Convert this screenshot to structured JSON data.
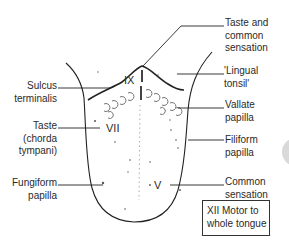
{
  "diagram": {
    "right_labels": [
      {
        "id": "taste_common",
        "lines": [
          "Taste and",
          "common",
          "sensation"
        ]
      },
      {
        "id": "lingual_tonsil",
        "lines": [
          "'Lingual",
          "tonsil'"
        ]
      },
      {
        "id": "vallate",
        "lines": [
          "Vallate",
          "papilla"
        ]
      },
      {
        "id": "filiform",
        "lines": [
          "Filiform",
          "papilla"
        ]
      },
      {
        "id": "common_sensation",
        "lines": [
          "Common",
          "sensation"
        ]
      }
    ],
    "left_labels": [
      {
        "id": "sulcus",
        "lines": [
          "Sulcus",
          "terminalis"
        ]
      },
      {
        "id": "taste_chorda",
        "lines": [
          "Taste",
          "(chorda",
          "tympani)"
        ]
      },
      {
        "id": "fungiform",
        "lines": [
          "Fungiform",
          "papilla"
        ]
      }
    ],
    "nerves": {
      "ix": "IX",
      "vii": "VII",
      "v": "V"
    },
    "motor_box": {
      "lines": [
        "XII Motor to",
        "whole tongue"
      ]
    },
    "colors": {
      "line": "#222222",
      "text": "#2a2a2a",
      "background": "#ffffff",
      "edge_artifact": "#d6d6d6"
    }
  }
}
